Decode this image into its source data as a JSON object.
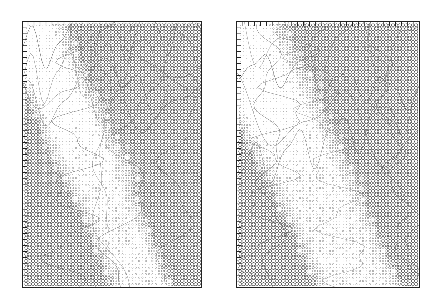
{
  "figure": {
    "name": "two-panel-symbol-grid-figure",
    "background_color": "#ffffff",
    "width": 427,
    "height": 305,
    "title": "",
    "caption": "",
    "has_legend": false,
    "has_axis_labels": false,
    "has_tick_labels": false,
    "ink_color": "#555555",
    "frame_color": "#222222",
    "contour_color": "#777777"
  },
  "panels": [
    {
      "id": "left-panel",
      "label": "",
      "x": 22,
      "y": 21,
      "width": 180,
      "height": 267,
      "grid": {
        "spacing": 3.32,
        "cols": 54,
        "rows": 80,
        "symbol": "open-circle",
        "size_min": 0.5,
        "size_max": 2.6
      },
      "axes": {
        "top_ticks": 30,
        "left_ticks": 44,
        "tick_length": 4,
        "tick_side": "inward",
        "bottom_ticks": 0,
        "right_ticks": 0
      },
      "band": {
        "description": "low-value blank diagonal band from upper-left to lower-middle",
        "slope": 1.55,
        "intercept": -0.04,
        "half_width": 0.085,
        "feather": 0.115
      },
      "field": {
        "description": "symbol magnitude increases toward lower-right and the upper-right lobe",
        "base_low": 0.06,
        "base_high": 0.94,
        "lower_saturation_row": 0.58
      }
    },
    {
      "id": "right-panel",
      "label": "",
      "x": 236,
      "y": 21,
      "width": 184,
      "height": 267,
      "grid": {
        "spacing": 3.32,
        "cols": 55,
        "rows": 80,
        "symbol": "open-circle",
        "size_min": 0.5,
        "size_max": 2.6
      },
      "axes": {
        "top_ticks": 30,
        "left_ticks": 44,
        "tick_length": 4,
        "tick_side": "inward",
        "bottom_ticks": 0,
        "right_ticks": 0
      },
      "band": {
        "description": "wider low-value blank diagonal band from upper-left to lower-middle",
        "slope": 1.45,
        "intercept": 0.02,
        "half_width": 0.125,
        "feather": 0.13
      },
      "field": {
        "description": "symbol magnitude increases toward lower-right and the upper-right lobe",
        "base_low": 0.06,
        "base_high": 0.94,
        "lower_saturation_row": 0.56
      }
    }
  ],
  "chart_data": {
    "type": "heatmap",
    "title": "",
    "subtitle": "",
    "xlabel": "",
    "ylabel": "",
    "legend_position": "none",
    "grid": false,
    "encoding": "symbol area proportional to value; open circles, grayscale ink",
    "panel_count": 2,
    "panel_names": [
      "left-panel",
      "right-panel"
    ],
    "xlim": [
      0,
      1
    ],
    "ylim": [
      0,
      1
    ],
    "value_range": [
      0,
      1
    ]
  },
  "contours": {
    "count_per_panel": 9,
    "stroke_width": 0.45,
    "description": "thin gray curvilinear boundaries overlaying the symbol field"
  }
}
